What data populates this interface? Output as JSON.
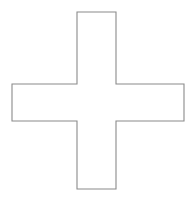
{
  "canvas": {
    "width": 194,
    "height": 202,
    "background_color": "#ffffff",
    "title": "Cross Shape"
  },
  "shape": {
    "name": "cross",
    "kind": "plus-sign-outline",
    "stroke_color": "#8a8a8a",
    "fill_color": "#ffffff",
    "stroke_width": 1.1,
    "bounds": {
      "x": 12,
      "y": 12,
      "width": 172,
      "height": 177
    },
    "vertical_arm": {
      "left": 77,
      "right": 116,
      "top": 12,
      "bottom": 189,
      "width": 39,
      "height": 177
    },
    "horizontal_arm": {
      "left": 12,
      "right": 184,
      "top": 84,
      "bottom": 121,
      "width": 172,
      "height": 37
    },
    "vertices": [
      [
        77,
        12
      ],
      [
        116,
        12
      ],
      [
        116,
        84
      ],
      [
        184,
        84
      ],
      [
        184,
        121
      ],
      [
        116,
        121
      ],
      [
        116,
        189
      ],
      [
        77,
        189
      ],
      [
        77,
        121
      ],
      [
        12,
        121
      ],
      [
        12,
        84
      ],
      [
        77,
        84
      ]
    ],
    "path": "M 77 12 L 116 12 L 116 84 L 184 84 L 184 121 L 116 121 L 116 189 L 77 189 L 77 121 L 12 121 L 12 84 L 77 84 Z"
  }
}
